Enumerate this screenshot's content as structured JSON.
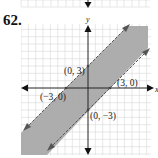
{
  "problem": {
    "number": "62."
  },
  "graph": {
    "x_axis_label": "x",
    "y_axis_label": "y",
    "points": [
      {
        "label": "(0, 3)",
        "x": 0,
        "y": 3
      },
      {
        "label": "(3, 0)",
        "x": 3,
        "y": 0
      },
      {
        "label": "(−3, 0)",
        "x": -3,
        "y": 0
      },
      {
        "label": "(0, −3)",
        "x": 0,
        "y": -3
      }
    ],
    "boundary_lines": [
      {
        "equation": "y = x + 3",
        "style": "dashed"
      },
      {
        "equation": "y = x − 3",
        "style": "dashed"
      }
    ],
    "shaded_region": "x − 3 < y < x + 3",
    "colors": {
      "shade": "#a9a9a9",
      "grid": "#d6d6d6",
      "axis": "#222222",
      "boundary": "#555555"
    }
  }
}
